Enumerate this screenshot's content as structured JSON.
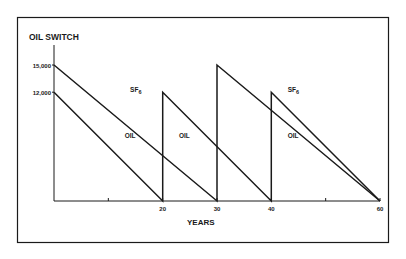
{
  "chart_data": {
    "type": "line",
    "title": "OIL SWITCH",
    "xlabel": "YEARS",
    "ylabel": "",
    "x_ticks": [
      10,
      20,
      30,
      40,
      50,
      60
    ],
    "x_tick_labels": [
      "",
      "20",
      "30",
      "40",
      "",
      "60"
    ],
    "y_tick_labels": [
      "15,000",
      "12,000"
    ],
    "y_ticks": [
      15000,
      12000
    ],
    "xlim": [
      0,
      60
    ],
    "ylim": [
      0,
      15000
    ],
    "grid": false,
    "series": [
      {
        "name": "SF6",
        "label_text": "SF",
        "label_sub": "6",
        "points": [
          [
            0,
            15000
          ],
          [
            30,
            0
          ],
          [
            30,
            15000
          ],
          [
            60,
            0
          ]
        ]
      },
      {
        "name": "OIL",
        "label_text": "OIL",
        "points": [
          [
            0,
            12000
          ],
          [
            20,
            0
          ],
          [
            20,
            12000
          ],
          [
            40,
            0
          ],
          [
            40,
            12000
          ],
          [
            60,
            0
          ]
        ]
      }
    ],
    "annotations": [
      {
        "text": "SF6",
        "series": "SF6",
        "x": 14,
        "y": 12000
      },
      {
        "text": "OIL",
        "series": "OIL",
        "x": 13,
        "y": 7000
      },
      {
        "text": "OIL",
        "series": "OIL",
        "x": 23,
        "y": 7000
      },
      {
        "text": "SF6",
        "series": "SF6",
        "x": 43,
        "y": 12000
      },
      {
        "text": "OIL",
        "series": "OIL",
        "x": 43,
        "y": 7000
      }
    ]
  },
  "colors": {
    "line": "#1a1a1a",
    "background": "#ffffff"
  }
}
